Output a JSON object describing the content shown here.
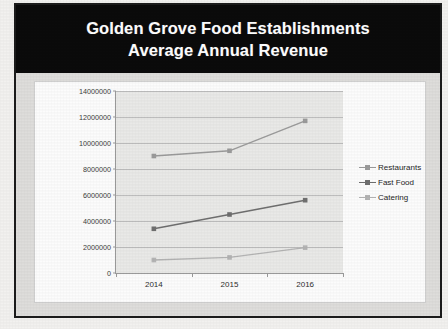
{
  "figure": {
    "title_line1": "Golden Grove Food Establishments",
    "title_line2": "Average Annual Revenue",
    "title_full": "Golden Grove Food Establishments Average Annual Revenue",
    "colors": {
      "title_banner_bg": "#0b0b0b",
      "title_text": "#ffffff",
      "frame_border": "#1c1c1c",
      "chart_frame_bg": "#dedddb",
      "chart_canvas_bg": "#fcfcfc",
      "plot_bg": "#e9e9e7",
      "gridline": "#bdbdbd",
      "axis": "#9a9a9a",
      "restaurants": "#9b9b9b",
      "fast_food": "#6f6f6f",
      "catering": "#b4b4b4"
    }
  },
  "chart_data": {
    "type": "line",
    "title": "Golden Grove Food Establishments Average Annual Revenue",
    "xlabel": "",
    "ylabel": "",
    "categories": [
      "2014",
      "2015",
      "2016"
    ],
    "ylim": [
      0,
      14000000
    ],
    "ytick_labels": [
      "14000000",
      "12000000",
      "10000000",
      "8000000",
      "6000000",
      "4000000",
      "2000000",
      "0"
    ],
    "ytick_values": [
      14000000,
      12000000,
      10000000,
      8000000,
      6000000,
      4000000,
      2000000,
      0
    ],
    "ytick_step": 2000000,
    "grid": true,
    "legend_position": "right",
    "series": [
      {
        "name": "Restaurants",
        "color": "#9b9b9b",
        "marker": "square",
        "values": [
          9000000,
          9400000,
          11700000
        ]
      },
      {
        "name": "Fast Food",
        "color": "#6f6f6f",
        "marker": "square",
        "values": [
          3400000,
          4500000,
          5600000
        ]
      },
      {
        "name": "Catering",
        "color": "#b4b4b4",
        "marker": "square",
        "values": [
          1000000,
          1200000,
          1950000
        ]
      }
    ]
  }
}
